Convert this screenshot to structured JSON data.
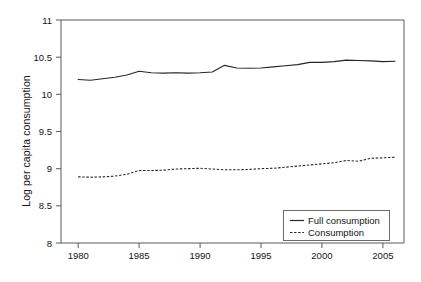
{
  "chart_data": {
    "type": "line",
    "title": "",
    "xlabel": "",
    "ylabel": "Log per capita consumption",
    "xlim": [
      1978.3,
      1007.0
    ],
    "ylim": [
      8,
      11
    ],
    "grid": false,
    "legend_position": "bottom-right",
    "x": [
      1980,
      1981,
      1982,
      1983,
      1984,
      1985,
      1986,
      1987,
      1988,
      1989,
      1990,
      1991,
      1992,
      1993,
      1994,
      1995,
      1996,
      1997,
      1998,
      1999,
      2000,
      2001,
      2002,
      2003,
      2004,
      2005,
      2006
    ],
    "xticks": [
      1980,
      1985,
      1990,
      1995,
      2000,
      2005
    ],
    "xtick_labels": [
      "1980",
      "1985",
      "1990",
      "1995",
      "2000",
      "2005"
    ],
    "yticks": [
      8,
      8.5,
      9,
      9.5,
      10,
      10.5,
      11
    ],
    "ytick_labels": [
      "8",
      "8.5",
      "9",
      "9.5",
      "10",
      "10.5",
      "11"
    ],
    "series": [
      {
        "name": "Full consumption",
        "style": "solid",
        "color": "#262626",
        "values": [
          10.2,
          10.19,
          10.21,
          10.23,
          10.26,
          10.31,
          10.29,
          10.285,
          10.29,
          10.285,
          10.29,
          10.3,
          10.39,
          10.355,
          10.35,
          10.355,
          10.37,
          10.385,
          10.4,
          10.43,
          10.43,
          10.44,
          10.46,
          10.455,
          10.45,
          10.44,
          10.445
        ]
      },
      {
        "name": "Consumption",
        "style": "dashed",
        "color": "#262626",
        "values": [
          8.89,
          8.885,
          8.89,
          8.9,
          8.925,
          8.975,
          8.975,
          8.98,
          8.995,
          9.0,
          9.005,
          8.995,
          8.985,
          8.985,
          8.99,
          9.0,
          9.005,
          9.02,
          9.035,
          9.05,
          9.065,
          9.08,
          9.11,
          9.1,
          9.14,
          9.145,
          9.155
        ]
      }
    ]
  },
  "legend": {
    "entries": [
      {
        "label": "Full consumption",
        "style": "solid"
      },
      {
        "label": "Consumption",
        "style": "dashed"
      }
    ]
  }
}
